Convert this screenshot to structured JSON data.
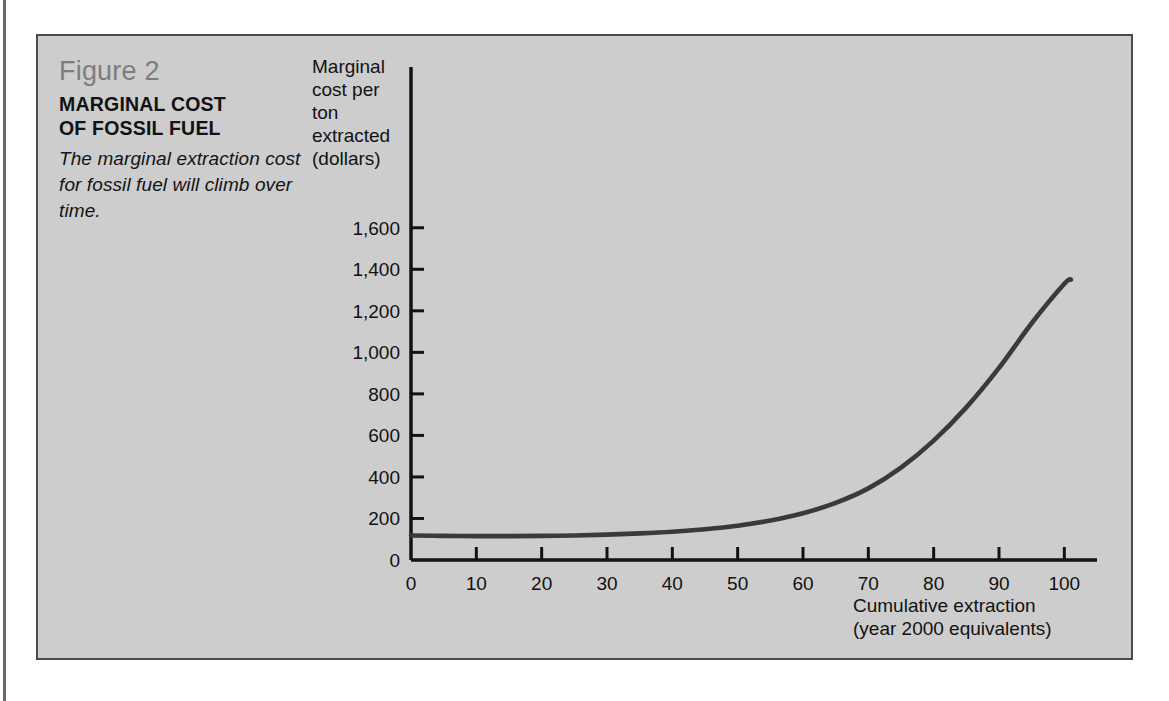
{
  "figure": {
    "number_label": "Figure 2",
    "title_line1": "MARGINAL COST",
    "title_line2": "OF FOSSIL FUEL",
    "subtitle": "The marginal extraction cost for fossil fuel will climb over time."
  },
  "axes": {
    "y_caption_line1": "Marginal",
    "y_caption_line2": "cost per",
    "y_caption_line3": "ton",
    "y_caption_line4": "extracted",
    "y_caption_line5": "(dollars)",
    "x_caption_line1": "Cumulative extraction",
    "x_caption_line2": "(year 2000 equivalents)"
  },
  "colors": {
    "panel_background": "#cdcdcd",
    "panel_border": "#4a4a4a",
    "axis": "#121212",
    "curve": "#3a3a3a",
    "figure_number_text": "#7d7d7d",
    "body_text": "#121212",
    "page_background": "#ffffff"
  },
  "chart_data": {
    "type": "line",
    "title": "MARGINAL COST OF FOSSIL FUEL",
    "subtitle": "The marginal extraction cost for fossil fuel will climb over time.",
    "xlabel": "Cumulative extraction (year 2000 equivalents)",
    "ylabel": "Marginal cost per ton extracted (dollars)",
    "xlim": [
      0,
      105
    ],
    "ylim": [
      0,
      1700
    ],
    "grid": false,
    "legend": false,
    "x_ticks": [
      0,
      10,
      20,
      30,
      40,
      50,
      60,
      70,
      80,
      90,
      100
    ],
    "x_tick_labels": [
      "0",
      "10",
      "20",
      "30",
      "40",
      "50",
      "60",
      "70",
      "80",
      "90",
      "100"
    ],
    "y_ticks": [
      0,
      200,
      400,
      600,
      800,
      1000,
      1200,
      1400,
      1600
    ],
    "y_tick_labels": [
      "0",
      "200",
      "400",
      "600",
      "800",
      "1,000",
      "1,200",
      "1,400",
      "1,600"
    ],
    "series": [
      {
        "name": "Marginal extraction cost",
        "x": [
          0,
          5,
          10,
          15,
          20,
          25,
          30,
          35,
          40,
          45,
          50,
          55,
          60,
          65,
          70,
          75,
          80,
          85,
          90,
          95,
          100,
          101
        ],
        "values": [
          118,
          116,
          115,
          115,
          116,
          118,
          122,
          128,
          136,
          148,
          165,
          190,
          225,
          275,
          345,
          445,
          575,
          735,
          925,
          1140,
          1330,
          1350
        ]
      }
    ]
  }
}
